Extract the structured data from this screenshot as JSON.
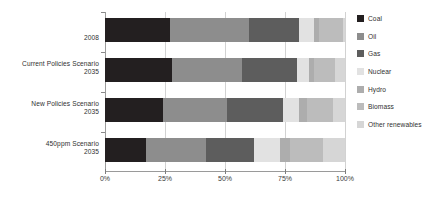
{
  "chart_data": {
    "type": "bar",
    "orientation": "horizontal",
    "stacked": true,
    "normalized": true,
    "title": "",
    "xlabel": "",
    "ylabel": "",
    "xlim": [
      0,
      100
    ],
    "grid": true,
    "legend_position": "right",
    "categories": [
      "2008",
      "Current Policies Scenario\n2035",
      "New Policies Scenario\n2035",
      "450ppm Scenario\n2035"
    ],
    "xticks": [
      "0%",
      "25%",
      "50%",
      "75%",
      "100%"
    ],
    "xtick_values": [
      0,
      25,
      50,
      75,
      100
    ],
    "series": [
      {
        "name": "Coal",
        "color": "#231f20",
        "values": [
          27,
          28,
          24,
          17
        ]
      },
      {
        "name": "Oil",
        "color": "#8d8d8d",
        "values": [
          33,
          29,
          27,
          25
        ]
      },
      {
        "name": "Gas",
        "color": "#5d5d5d",
        "values": [
          21,
          23,
          23,
          20
        ]
      },
      {
        "name": "Nuclear",
        "color": "#e2e2e2",
        "values": [
          6,
          5,
          7,
          11
        ]
      },
      {
        "name": "Hydro",
        "color": "#adadad",
        "values": [
          2,
          2,
          3,
          4
        ]
      },
      {
        "name": "Biomass",
        "color": "#bcbcbc",
        "values": [
          10,
          9,
          11,
          14
        ]
      },
      {
        "name": "Other renewables",
        "color": "#d6d6d6",
        "values": [
          1,
          4,
          5,
          9
        ]
      }
    ]
  },
  "legend": {
    "items": [
      {
        "label": "Coal"
      },
      {
        "label": "Oil"
      },
      {
        "label": "Gas"
      },
      {
        "label": "Nuclear"
      },
      {
        "label": "Hydro"
      },
      {
        "label": "Biomass"
      },
      {
        "label": "Other renewables"
      }
    ]
  },
  "style": {
    "axis_color": "#9a9a9a",
    "grid_color": "#d2d2d2",
    "text_color": "#2f2f2f",
    "background": "#ffffff"
  }
}
